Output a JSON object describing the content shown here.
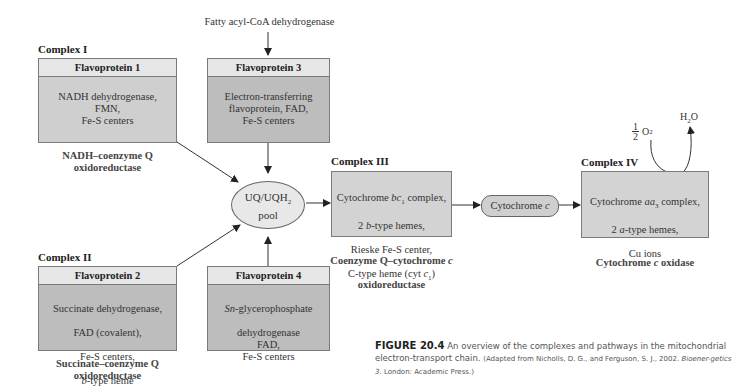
{
  "top_label": "Fatty acyl-CoA dehydrogenase",
  "complex1": {
    "label": "Complex I",
    "header": "Flavoprotein 1",
    "body": "NADH dehydrogenase,\nFMN,\nFe-S centers",
    "subtitle": "NADH–coenzyme Q\noxidoreductase"
  },
  "flavo3": {
    "header": "Flavoprotein 3",
    "body": "Electron-transferring\nflavoprotein, FAD,\nFe-S centers"
  },
  "complex2": {
    "label": "Complex II",
    "header": "Flavoprotein 2",
    "body_lines": [
      "Succinate dehydrogenase,",
      "FAD (covalent),",
      "Fe-S centers,"
    ],
    "body_italic_prefix": "b",
    "body_last": "-type heme",
    "subtitle": "Succinate–coenzyme Q\noxidoreductase"
  },
  "flavo4": {
    "header": "Flavoprotein 4",
    "italic_prefix": "Sn",
    "line1_rest": "-glycerophosphate",
    "body_rest": "dehydrogenase\nFAD,\nFe-S centers"
  },
  "pool": {
    "line1": "UQ/UQH",
    "sub": "2",
    "line2": "pool"
  },
  "complex3": {
    "label": "Complex III",
    "line1a": "Cytochrome ",
    "line1i": "bc",
    "line1s": "1",
    "line1b": " complex,",
    "line2a": "2 ",
    "line2i": "b",
    "line2b": "-type hemes,",
    "line3": "Rieske Fe-S center,",
    "line4a": "C-type heme (cyt ",
    "line4i": "c",
    "line4s": "1",
    "line4b": ")",
    "subtitle1": "Coenzyme Q–cytochrome ",
    "subtitle1i": "c",
    "subtitle2": "oxidoreductase"
  },
  "cytc": {
    "text": "Cytochrome ",
    "italic": "c"
  },
  "complex4": {
    "label": "Complex IV",
    "line1a": "Cytochrome ",
    "line1i": "aa",
    "line1s": "3",
    "line1b": " complex,",
    "line2a": "2 ",
    "line2i": "a",
    "line2b": "-type hemes,",
    "line3": "Cu ions",
    "subtitle_a": "Cytochrome ",
    "subtitle_i": "c",
    "subtitle_b": " oxidase"
  },
  "oxygen": {
    "num": "1",
    "den": "2",
    "o2": "O",
    "o2sub": "2",
    "water": "H",
    "water_sub": "2",
    "water_o": "O"
  },
  "caption": {
    "figure": "FIGURE 20.4",
    "text": " An overview of the complexes and pathways in the mitochondrial electron-transport chain. ",
    "source_a": "(Adapted from Nicholls, D. G., and Ferguson, S. J., 2002. ",
    "source_i": "Bioener-getics 3",
    "source_b": ". London: Academic Press.)"
  }
}
